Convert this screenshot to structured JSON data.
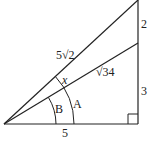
{
  "diagram": {
    "type": "right-triangle-angle-diagram",
    "stroke_color": "#222222",
    "background": "#ffffff",
    "points": {
      "origin": [
        4,
        124
      ],
      "base_right": [
        138,
        124
      ],
      "mid_right": [
        138,
        43
      ],
      "top_right": [
        138,
        0
      ]
    },
    "segments": {
      "base": {
        "label": "5"
      },
      "right_lower": {
        "label": "3"
      },
      "right_upper": {
        "label": "2"
      },
      "hyp_inner": {
        "label": "√34"
      },
      "hyp_outer": {
        "label": "5√2"
      }
    },
    "angles": {
      "x": {
        "label": "x"
      },
      "A": {
        "label": "A"
      },
      "B": {
        "label": "B"
      }
    },
    "right_angle_marker": true
  }
}
